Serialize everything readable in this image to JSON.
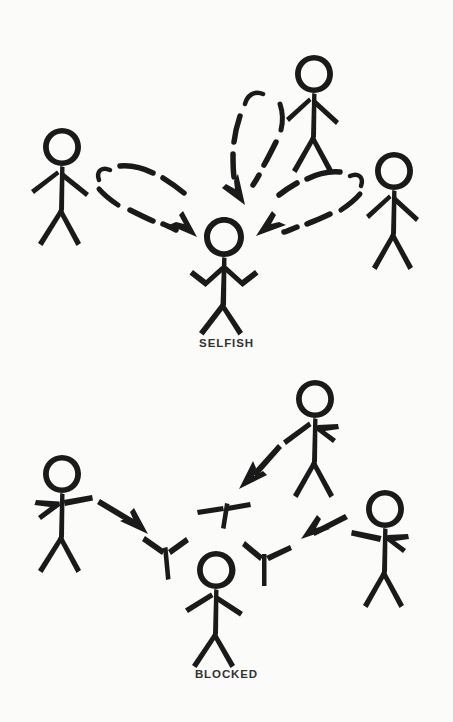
{
  "figure": {
    "background_color": "#fbfbfa",
    "ink_color": "#1a1a1a",
    "caption_color": "#333333",
    "style": "hand-drawn-stick-figure-diagram",
    "width": 453,
    "height": 722
  },
  "panels": [
    {
      "id": "selfish",
      "caption": "SELFISH",
      "caption_y": 348,
      "arrow_style": "dashed-looping-boomerang",
      "description": "Three outer stick figures send messages toward a central figure; each dashed arrow loops back and points at the central figure, which shrugs with both arms raised.",
      "center_figure": {
        "name": "selfish-center-figure",
        "pose": "shrugging-arms-up",
        "x": 224,
        "y": 265
      },
      "outer_figures": [
        {
          "name": "selfish-left-figure",
          "pose": "standing-arms-down",
          "x": 62,
          "y": 185
        },
        {
          "name": "selfish-top-figure",
          "pose": "standing-arms-down",
          "x": 314,
          "y": 110
        },
        {
          "name": "selfish-right-figure",
          "pose": "standing-arms-down",
          "x": 394,
          "y": 210
        }
      ],
      "arrows": [
        {
          "name": "selfish-arrow-left",
          "from": "selfish-left-figure",
          "to": "selfish-center-figure",
          "kind": "dashed-loop"
        },
        {
          "name": "selfish-arrow-top",
          "from": "selfish-top-figure",
          "to": "selfish-center-figure",
          "kind": "dashed-loop"
        },
        {
          "name": "selfish-arrow-right",
          "from": "selfish-right-figure",
          "to": "selfish-center-figure",
          "kind": "dashed-loop"
        }
      ]
    },
    {
      "id": "blocked",
      "caption": "BLOCKED",
      "caption_y": 679,
      "arrow_style": "solid-arrow-stopped-by-barrier",
      "description": "Three outer stick figures send solid arrows toward a central figure, but each arrow is stopped by a Y-shaped barrier mark before reaching the centre figure, whose arms hang down.",
      "center_figure": {
        "name": "blocked-center-figure",
        "pose": "standing-arms-down",
        "x": 216,
        "y": 600
      },
      "outer_figures": [
        {
          "name": "blocked-left-figure",
          "pose": "pointing-right-arm-extended",
          "x": 62,
          "y": 510
        },
        {
          "name": "blocked-top-figure",
          "pose": "pointing-left-arm-extended",
          "x": 315,
          "y": 435
        },
        {
          "name": "blocked-right-figure",
          "pose": "pointing-left-arm-extended",
          "x": 385,
          "y": 545
        }
      ],
      "arrows": [
        {
          "name": "blocked-arrow-left",
          "from": "blocked-left-figure",
          "to": "blocked-center-figure",
          "kind": "solid",
          "blocked": true
        },
        {
          "name": "blocked-arrow-top",
          "from": "blocked-top-figure",
          "to": "blocked-center-figure",
          "kind": "solid",
          "blocked": true
        },
        {
          "name": "blocked-arrow-right",
          "from": "blocked-right-figure",
          "to": "blocked-center-figure",
          "kind": "solid",
          "blocked": true
        }
      ],
      "barriers": [
        {
          "name": "blocked-barrier-left",
          "shape": "y-mark"
        },
        {
          "name": "blocked-barrier-top",
          "shape": "y-mark"
        },
        {
          "name": "blocked-barrier-right",
          "shape": "y-mark"
        }
      ]
    }
  ]
}
